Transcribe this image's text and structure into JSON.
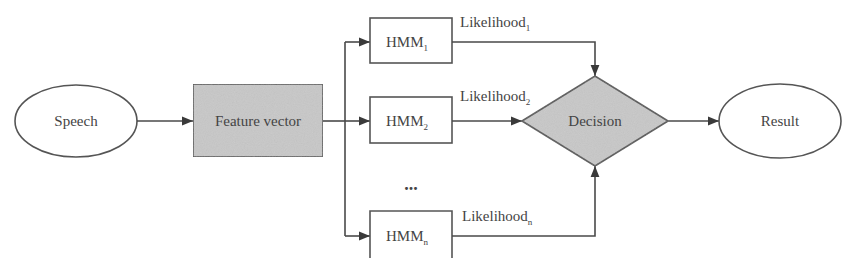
{
  "diagram": {
    "type": "flowchart",
    "colors": {
      "line": "#4a4a4a",
      "shaded_fill": "#c8c8c8",
      "plain_fill": "#ffffff",
      "text": "#444444"
    },
    "nodes": {
      "speech": {
        "label": "Speech",
        "shape": "ellipse"
      },
      "feature_vector": {
        "label": "Feature vector",
        "shape": "rectangle-shaded"
      },
      "hmm1": {
        "label": "HMM",
        "subscript": "1",
        "shape": "rectangle"
      },
      "hmm2": {
        "label": "HMM",
        "subscript": "2",
        "shape": "rectangle"
      },
      "ellipsis": {
        "label": "..."
      },
      "hmmn": {
        "label": "HMM",
        "subscript": "n",
        "shape": "rectangle"
      },
      "decision": {
        "label": "Decision",
        "shape": "diamond-shaded"
      },
      "result": {
        "label": "Result",
        "shape": "ellipse"
      }
    },
    "edges": {
      "likelihood1": {
        "label": "Likelihood",
        "subscript": "1"
      },
      "likelihood2": {
        "label": "Likelihood",
        "subscript": "2"
      },
      "likelihoodn": {
        "label": "Likelihood",
        "subscript": "n"
      }
    }
  }
}
